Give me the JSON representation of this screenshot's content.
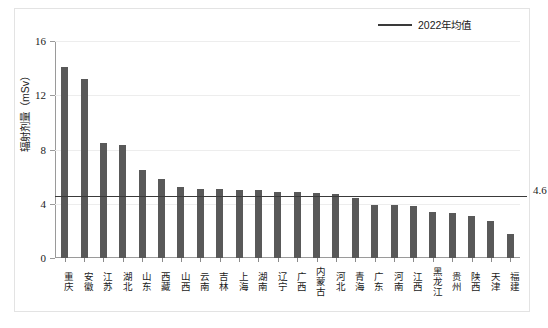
{
  "chart_data": {
    "type": "bar",
    "title": "",
    "xlabel": "",
    "ylabel": "辐射剂量（mSv）",
    "ylim": [
      0,
      16
    ],
    "yticks": [
      0,
      4,
      8,
      12,
      16
    ],
    "grid": true,
    "legend_position": "top-right",
    "legend": [
      {
        "label": "2022年均值",
        "type": "line",
        "color": "#3a3a3a"
      }
    ],
    "bar_color": "#595959",
    "categories": [
      "重庆",
      "安徽",
      "江苏",
      "湖北",
      "山东",
      "西藏",
      "山西",
      "云南",
      "吉林",
      "上海",
      "湖南",
      "辽宁",
      "广西",
      "内蒙古",
      "河北",
      "青海",
      "广东",
      "河南",
      "江西",
      "黑龙江",
      "贵州",
      "陕西",
      "天津",
      "福建"
    ],
    "values": [
      14.1,
      13.2,
      8.5,
      8.3,
      6.5,
      5.8,
      5.2,
      5.1,
      5.1,
      5.0,
      5.0,
      4.9,
      4.9,
      4.8,
      4.7,
      4.4,
      3.9,
      3.9,
      3.8,
      3.4,
      3.3,
      3.1,
      2.7,
      1.8
    ],
    "reference_line": {
      "value": 4.6,
      "label": "4.6",
      "color": "#3a3a3a",
      "legend_name": "2022年均值"
    }
  }
}
